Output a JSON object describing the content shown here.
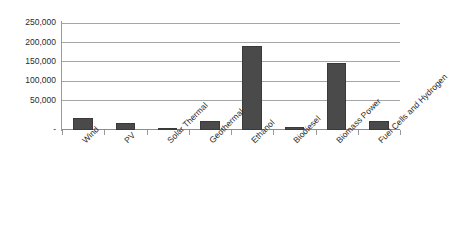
{
  "chart_data": {
    "type": "bar",
    "title": "",
    "subtitle": "",
    "xlabel": "",
    "ylabel": "",
    "categories": [
      "Wind",
      "PV",
      "Solar Thermal",
      "Geothermal",
      "Ethanol",
      "Biodiesel",
      "Biomass Power",
      "Fuel Cells and Hydrogen"
    ],
    "values": [
      29000,
      17000,
      3000,
      20000,
      195000,
      6000,
      157000,
      20000
    ],
    "ylim": [
      0,
      250000
    ],
    "ytick_values": [
      0,
      50000,
      100000,
      150000,
      200000,
      250000
    ],
    "ytick_labels": [
      "-",
      "50,000",
      "100,000",
      "150,000",
      "200,000",
      "250,000"
    ],
    "grid": true,
    "legend": false,
    "legend_position": "none",
    "series": [
      {
        "name": "",
        "values": [
          29000,
          17000,
          3000,
          20000,
          195000,
          6000,
          157000,
          20000
        ]
      }
    ],
    "colors": {
      "bar": "#4a4a4a",
      "bar_border": "#3a3a3a",
      "gridline": "#a6a6a6",
      "axis": "#9a9a9a",
      "text": "#2b2b2b",
      "background": "#ffffff"
    }
  }
}
